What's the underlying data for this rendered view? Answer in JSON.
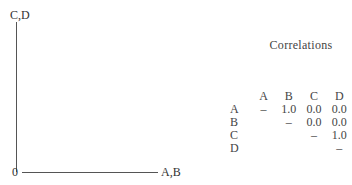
{
  "plot": {
    "y_label": "C,D",
    "x_label": "A,B",
    "origin_label": "0"
  },
  "correlations": {
    "title": "Correlations",
    "columns": [
      "A",
      "B",
      "C",
      "D"
    ],
    "rows": [
      {
        "label": "A",
        "cells": [
          "–",
          "1.0",
          "0.0",
          "0.0"
        ]
      },
      {
        "label": "B",
        "cells": [
          "",
          "–",
          "0.0",
          "0.0"
        ]
      },
      {
        "label": "C",
        "cells": [
          "",
          "",
          "–",
          "1.0"
        ]
      },
      {
        "label": "D",
        "cells": [
          "",
          "",
          "",
          "–"
        ]
      }
    ]
  }
}
